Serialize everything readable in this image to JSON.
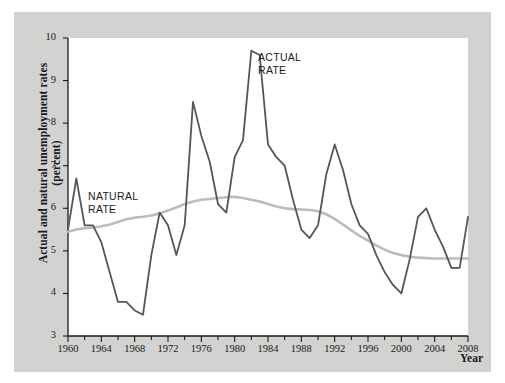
{
  "figure": {
    "background_color": "#d2d2d0",
    "plot_background_color": "#ffffff"
  },
  "axes": {
    "y_title_line1": "Actual and natural unemployment rates",
    "y_title_line2": "(percent)",
    "x_title": "Year",
    "y_ticks": [
      "3",
      "4",
      "5",
      "6",
      "7",
      "8",
      "9",
      "10"
    ],
    "x_ticks": [
      "1960",
      "1964",
      "1968",
      "1972",
      "1976",
      "1980",
      "1984",
      "1988",
      "1992",
      "1996",
      "2000",
      "2004",
      "2008"
    ]
  },
  "annotations": {
    "actual_line1": "ACTUAL",
    "actual_line2": "RATE",
    "natural_line1": "NATURAL",
    "natural_line2": "RATE"
  },
  "chart_data": {
    "type": "line",
    "title": "",
    "xlabel": "Year",
    "ylabel": "Actual and natural unemployment rates (percent)",
    "xlim": [
      1960,
      2008
    ],
    "ylim": [
      3,
      10
    ],
    "grid": false,
    "legend_position": "inline-annotation",
    "x_tick_interval": 4,
    "x_minor_tick_interval": 2,
    "y_tick_interval": 1,
    "x": [
      1960,
      1961,
      1962,
      1963,
      1964,
      1965,
      1966,
      1967,
      1968,
      1969,
      1970,
      1971,
      1972,
      1973,
      1974,
      1975,
      1976,
      1977,
      1978,
      1979,
      1980,
      1981,
      1982,
      1983,
      1984,
      1985,
      1986,
      1987,
      1988,
      1989,
      1990,
      1991,
      1992,
      1993,
      1994,
      1995,
      1996,
      1997,
      1998,
      1999,
      2000,
      2001,
      2002,
      2003,
      2004,
      2005,
      2006,
      2007,
      2008
    ],
    "series": [
      {
        "name": "ACTUAL RATE",
        "color": "#565656",
        "line_width": 1.8,
        "values": [
          5.5,
          6.7,
          5.6,
          5.6,
          5.2,
          4.5,
          3.8,
          3.8,
          3.6,
          3.5,
          4.9,
          5.9,
          5.6,
          4.9,
          5.6,
          8.5,
          7.7,
          7.1,
          6.1,
          5.9,
          7.2,
          7.6,
          9.7,
          9.6,
          7.5,
          7.2,
          7.0,
          6.2,
          5.5,
          5.3,
          5.6,
          6.8,
          7.5,
          6.9,
          6.1,
          5.6,
          5.4,
          4.9,
          4.5,
          4.2,
          4.0,
          4.8,
          5.8,
          6.0,
          5.5,
          5.1,
          4.6,
          4.6,
          5.8
        ]
      },
      {
        "name": "NATURAL RATE",
        "color": "#bcbcbc",
        "line_width": 2.6,
        "values": [
          5.45,
          5.5,
          5.53,
          5.55,
          5.58,
          5.62,
          5.68,
          5.74,
          5.78,
          5.8,
          5.83,
          5.88,
          5.95,
          6.02,
          6.1,
          6.16,
          6.2,
          6.22,
          6.24,
          6.26,
          6.27,
          6.24,
          6.2,
          6.16,
          6.1,
          6.04,
          6.0,
          5.98,
          5.97,
          5.96,
          5.93,
          5.86,
          5.75,
          5.62,
          5.48,
          5.35,
          5.24,
          5.13,
          5.03,
          4.95,
          4.9,
          4.86,
          4.84,
          4.83,
          4.82,
          4.82,
          4.82,
          4.82,
          4.82
        ]
      }
    ]
  }
}
